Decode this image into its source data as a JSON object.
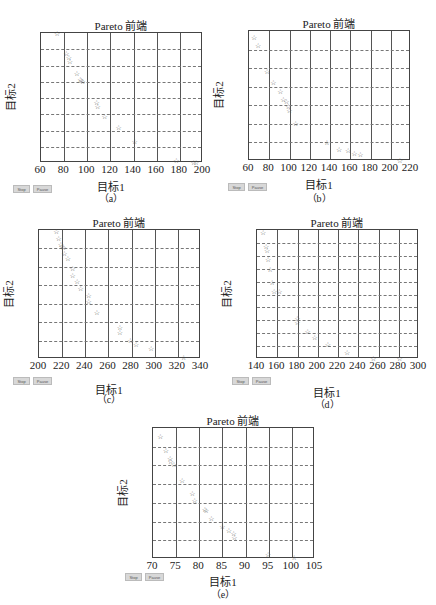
{
  "controls": {
    "stop_label": "Stop",
    "pause_label": "Pause"
  },
  "colors": {
    "marker": "#555555",
    "axis": "#444444",
    "grid": "#777777"
  },
  "chart_data": [
    {
      "id": "a",
      "type": "scatter",
      "title": "Pareto 前端",
      "xlabel": "目标1",
      "ylabel": "目标2",
      "caption": "（a）",
      "marker": "star",
      "xlim": [
        60,
        200
      ],
      "ylim": [
        0,
        800
      ],
      "xticks": [
        60,
        80,
        100,
        120,
        140,
        160,
        180,
        200
      ],
      "yticks": [
        0,
        100,
        200,
        300,
        400,
        500,
        600,
        700,
        800
      ],
      "grid": true,
      "layout": {
        "plot": [
          40,
          32,
          162,
          130
        ],
        "btn_y": 185,
        "btn_x": 13,
        "xlabel_y": 178,
        "caption_y": 190
      },
      "x": [
        74,
        82,
        84,
        85,
        91,
        94,
        95,
        96,
        108,
        109,
        115,
        127,
        141,
        177,
        192,
        194
      ],
      "y": [
        795,
        670,
        645,
        620,
        550,
        510,
        505,
        500,
        370,
        345,
        285,
        215,
        130,
        10,
        0,
        0
      ]
    },
    {
      "id": "b",
      "type": "scatter",
      "title": "Pareto 前端",
      "xlabel": "目标1",
      "ylabel": "目标2",
      "caption": "（b）",
      "marker": "star",
      "xlim": [
        60,
        220
      ],
      "ylim": [
        0,
        700
      ],
      "xticks": [
        60,
        80,
        100,
        120,
        140,
        160,
        180,
        200,
        220
      ],
      "yticks": [
        0,
        100,
        200,
        300,
        400,
        500,
        600,
        700
      ],
      "grid": true,
      "layout": {
        "plot": [
          248,
          30,
          162,
          130
        ],
        "btn_y": 183,
        "btn_x": 228,
        "xlabel_y": 176,
        "caption_y": 190
      },
      "x": [
        65,
        69,
        78,
        84,
        91,
        94,
        97,
        99,
        100,
        106,
        137,
        149,
        158,
        164,
        170,
        209
      ],
      "y": [
        665,
        620,
        480,
        420,
        370,
        330,
        320,
        290,
        270,
        200,
        95,
        60,
        55,
        40,
        30,
        0
      ]
    },
    {
      "id": "c",
      "type": "scatter",
      "title": "Pareto 前端",
      "xlabel": "目标1",
      "ylabel": "目标2",
      "caption": "（c）",
      "marker": "star",
      "xlim": [
        200,
        340
      ],
      "ylim": [
        0,
        350
      ],
      "xticks": [
        200,
        220,
        240,
        260,
        280,
        300,
        320,
        340
      ],
      "yticks": [
        0,
        50,
        100,
        150,
        200,
        250,
        300,
        350
      ],
      "grid": true,
      "layout": {
        "plot": [
          38,
          229,
          162,
          129
        ],
        "btn_y": 377,
        "btn_x": 13,
        "xlabel_y": 381,
        "caption_y": 391
      },
      "x": [
        215,
        217,
        219,
        220,
        221,
        222,
        225,
        229,
        229,
        233,
        236,
        243,
        243,
        250,
        270,
        270,
        279,
        284,
        297,
        325
      ],
      "y": [
        345,
        325,
        310,
        305,
        300,
        285,
        270,
        245,
        225,
        210,
        190,
        170,
        155,
        125,
        85,
        70,
        50,
        38,
        27,
        2
      ]
    },
    {
      "id": "d",
      "type": "scatter",
      "title": "Pareto 前端",
      "xlabel": "目标1",
      "ylabel": "目标2",
      "caption": "（d）",
      "marker": "star",
      "xlim": [
        140,
        300
      ],
      "ylim": [
        0,
        100
      ],
      "xticks": [
        140,
        160,
        180,
        200,
        220,
        240,
        260,
        280,
        300
      ],
      "yticks": [
        0,
        10,
        20,
        30,
        40,
        50,
        60,
        70,
        80,
        90,
        100
      ],
      "grid": true,
      "layout": {
        "plot": [
          256,
          229,
          162,
          129
        ],
        "btn_y": 377,
        "btn_x": 232,
        "xlabel_y": 384,
        "caption_y": 396
      },
      "x": [
        146,
        149,
        150,
        151,
        153,
        155,
        157,
        162,
        180,
        180,
        190,
        197,
        210,
        229,
        255,
        281
      ],
      "y": [
        98,
        87,
        84,
        77,
        69,
        59,
        52,
        52,
        31,
        28,
        21,
        16,
        11,
        5,
        0,
        0
      ]
    },
    {
      "id": "e",
      "type": "scatter",
      "title": "Pareto 前端",
      "xlabel": "目标1",
      "ylabel": "目标2",
      "caption": "（e）",
      "marker": "star",
      "xlim": [
        70,
        105
      ],
      "ylim": [
        0,
        35
      ],
      "xticks": [
        70,
        75,
        80,
        85,
        90,
        95,
        100,
        105
      ],
      "yticks": [
        0,
        5,
        10,
        15,
        20,
        25,
        30,
        35
      ],
      "grid": true,
      "layout": {
        "plot": [
          152,
          427,
          162,
          131
        ],
        "btn_y": 573,
        "btn_x": 125,
        "xlabel_y": 573,
        "caption_y": 586
      },
      "x": [
        71.6,
        72.8,
        73.7,
        73.8,
        74.5,
        76.3,
        78.5,
        79.0,
        81.2,
        81.5,
        82.6,
        85.0,
        86.4,
        87.4,
        87.6,
        94.9,
        100.5
      ],
      "y": [
        32.5,
        28.8,
        26.7,
        26.0,
        25.0,
        20.8,
        17.5,
        15.5,
        13.2,
        12.8,
        10.8,
        8.5,
        7.5,
        6.7,
        5.5,
        1.2,
        0.2
      ]
    }
  ]
}
